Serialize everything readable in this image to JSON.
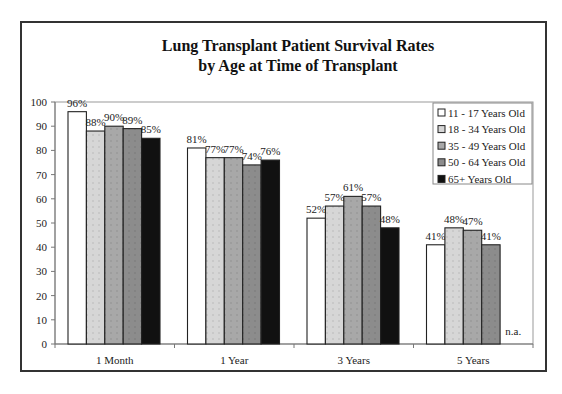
{
  "chart_data": {
    "type": "bar",
    "title": "Lung Transplant Patient Survival Rates",
    "subtitle": "by Age at Time of Transplant",
    "xlabel": "",
    "ylabel": "",
    "ylim": [
      0,
      100
    ],
    "yticks": [
      0,
      10,
      20,
      30,
      40,
      50,
      60,
      70,
      80,
      90,
      100
    ],
    "grid": false,
    "legend_position": "top-right inside",
    "categories": [
      "1 Month",
      "1 Year",
      "3 Years",
      "5 Years"
    ],
    "series": [
      {
        "name": "11 - 17 Years Old",
        "color": "#ffffff",
        "values": [
          96,
          81,
          52,
          41
        ],
        "labels": [
          "96%",
          "81%",
          "52%",
          "41%"
        ]
      },
      {
        "name": "18 - 34 Years Old",
        "color": "#d6d6d6",
        "values": [
          88,
          77,
          57,
          48
        ],
        "labels": [
          "88%",
          "77%",
          "57%",
          "48%"
        ]
      },
      {
        "name": "35 - 49 Years Old",
        "color": "#a8a8a8",
        "values": [
          90,
          77,
          61,
          47
        ],
        "labels": [
          "90%",
          "77%",
          "61%",
          "47%"
        ]
      },
      {
        "name": "50 - 64 Years Old",
        "color": "#8c8c8c",
        "values": [
          89,
          74,
          57,
          41
        ],
        "labels": [
          "89%",
          "74%",
          "57%",
          "41%"
        ]
      },
      {
        "name": "65+ Years Old",
        "color": "#111111",
        "values": [
          85,
          76,
          48,
          null
        ],
        "labels": [
          "85%",
          "76%",
          "48%",
          "n.a."
        ]
      }
    ],
    "annotations": [
      "n.a."
    ]
  }
}
